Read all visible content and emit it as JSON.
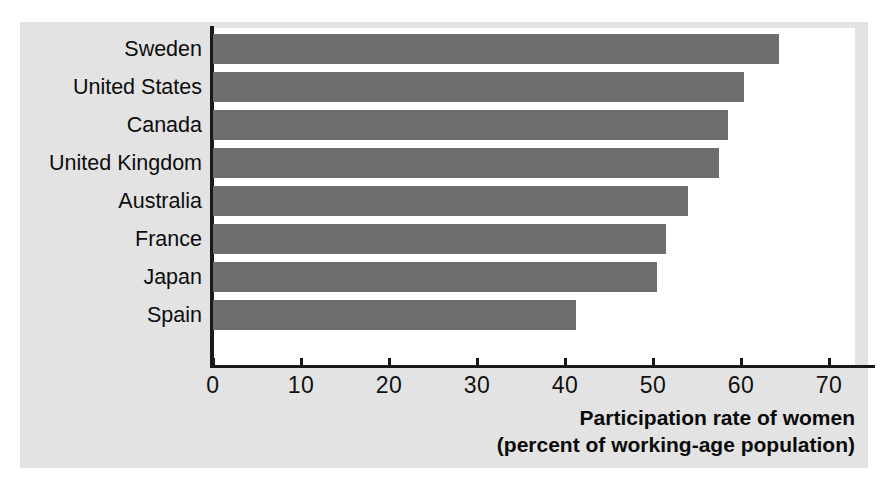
{
  "chart_data": {
    "type": "bar",
    "orientation": "horizontal",
    "title": "",
    "xlabel": "Participation rate of women (percent of working-age population)",
    "ylabel": "",
    "xlim": [
      0,
      73
    ],
    "grid": false,
    "legend": false,
    "categories": [
      "Sweden",
      "United States",
      "Canada",
      "United Kingdom",
      "Australia",
      "France",
      "Japan",
      "Spain"
    ],
    "values": [
      64.3,
      60.3,
      58.5,
      57.5,
      54.0,
      51.5,
      50.5,
      41.3
    ],
    "xticks": [
      0,
      10,
      20,
      30,
      40,
      50,
      60,
      70
    ],
    "xtick_labels": [
      "0",
      "10",
      "20",
      "30",
      "40",
      "50",
      "60",
      "70"
    ],
    "bar_color": "#6e6e6e",
    "panel_color": "#ffffff",
    "figure_color": "#e3e3e3",
    "axis_color": "#1a1a1a"
  },
  "axis_title": {
    "line1": "Participation rate of women",
    "line2": "(percent of working-age population)"
  }
}
